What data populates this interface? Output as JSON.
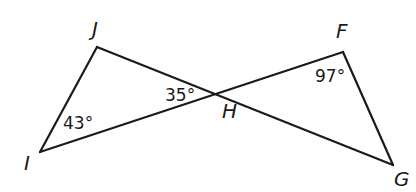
{
  "diagram": {
    "vertices": {
      "J": {
        "label": "J",
        "x": 97,
        "y": 47,
        "label_x": 92,
        "label_y": 36
      },
      "I": {
        "label": "I",
        "x": 40,
        "y": 152,
        "label_x": 24,
        "label_y": 170
      },
      "H": {
        "label": "H",
        "x": 225,
        "y": 90,
        "label_x": 222,
        "label_y": 118
      },
      "F": {
        "label": "F",
        "x": 343,
        "y": 52,
        "label_x": 336,
        "label_y": 38
      },
      "G": {
        "label": "G",
        "x": 393,
        "y": 165,
        "label_x": 394,
        "label_y": 186
      }
    },
    "segments": [
      {
        "from": "J",
        "to": "I"
      },
      {
        "from": "J",
        "to": "G"
      },
      {
        "from": "I",
        "to": "F"
      },
      {
        "from": "F",
        "to": "G"
      }
    ],
    "angles": [
      {
        "vertex": "I",
        "text": "43°",
        "x": 63,
        "y": 129
      },
      {
        "vertex": "H",
        "text": "35°",
        "x": 165,
        "y": 101
      },
      {
        "vertex": "F",
        "text": "97°",
        "x": 315,
        "y": 82
      }
    ],
    "colors": {
      "stroke": "#1a1a1a",
      "background": "#ffffff"
    }
  }
}
